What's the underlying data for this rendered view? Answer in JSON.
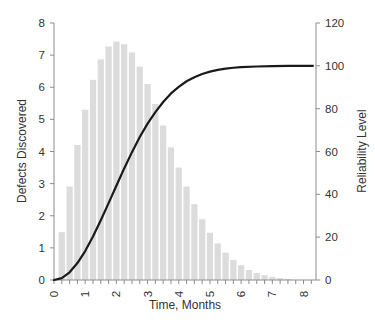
{
  "chart_data": {
    "type": "bar+line",
    "title": "",
    "xlabel": "Time, Months",
    "ylabel_left": "Defects Discovered",
    "ylabel_right": "Reliability Level",
    "xlim": [
      0,
      8.4
    ],
    "ylim_left": [
      0,
      8
    ],
    "ylim_right": [
      0,
      120
    ],
    "x_ticks": [
      "0",
      "1",
      "2",
      "3",
      "4",
      "5",
      "6",
      "7",
      "8"
    ],
    "x_minor_step": 0.25,
    "y_left_ticks": [
      "0",
      "1",
      "2",
      "3",
      "4",
      "5",
      "6",
      "7",
      "8"
    ],
    "y_right_ticks": [
      "0",
      "20",
      "40",
      "60",
      "80",
      "100",
      "120"
    ],
    "grid": false,
    "legend": "none",
    "colors": {
      "bars": "#dcdcdc",
      "curve": "#1a1a1a",
      "axis": "#8c8c8c",
      "text": "#333333"
    },
    "series": [
      {
        "name": "Defects Discovered",
        "type": "bar",
        "axis": "left",
        "x": [
          0.25,
          0.5,
          0.75,
          1.0,
          1.25,
          1.5,
          1.75,
          2.0,
          2.25,
          2.5,
          2.75,
          3.0,
          3.25,
          3.5,
          3.75,
          4.0,
          4.25,
          4.5,
          4.75,
          5.0,
          5.25,
          5.5,
          5.75,
          6.0,
          6.25,
          6.5,
          6.75,
          7.0,
          7.25,
          7.5
        ],
        "values": [
          1.49,
          2.91,
          4.2,
          5.3,
          6.23,
          6.87,
          7.27,
          7.42,
          7.34,
          7.08,
          6.64,
          6.1,
          5.48,
          4.81,
          4.13,
          3.5,
          2.91,
          2.36,
          1.89,
          1.47,
          1.14,
          0.85,
          0.62,
          0.46,
          0.31,
          0.22,
          0.15,
          0.1,
          0.06,
          0.03
        ]
      },
      {
        "name": "Reliability Level",
        "type": "line",
        "axis": "right",
        "x": [
          0,
          0.25,
          0.5,
          0.75,
          1.0,
          1.25,
          1.5,
          1.75,
          2.0,
          2.25,
          2.5,
          2.75,
          3.0,
          3.25,
          3.5,
          3.75,
          4.0,
          4.25,
          4.5,
          4.75,
          5.0,
          5.25,
          5.5,
          5.75,
          6.0,
          6.5,
          7.0,
          7.5,
          8.0,
          8.3
        ],
        "values": [
          0,
          0.9,
          3.6,
          7.9,
          13.5,
          20.3,
          27.9,
          35.9,
          44.0,
          52.1,
          59.7,
          66.8,
          73.0,
          78.4,
          83.1,
          87.1,
          90.2,
          92.8,
          94.7,
          96.2,
          97.3,
          98.1,
          98.7,
          99.1,
          99.4,
          99.7,
          99.9,
          100,
          100,
          100
        ]
      }
    ]
  }
}
